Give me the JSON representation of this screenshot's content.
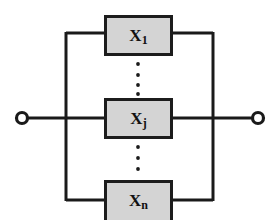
{
  "figure": {
    "kind": "reliability-block-diagram",
    "topology": "parallel",
    "background_color": "#ffffff",
    "line_color": "#1a1a1a",
    "block_fill_color": "#d4d4d4",
    "block_border_color": "#1c1c1c"
  },
  "terminals": {
    "left": {
      "name": "left-terminal",
      "cx": 22,
      "cy": 118,
      "r": 6
    },
    "right": {
      "name": "right-terminal",
      "cx": 258,
      "cy": 118,
      "r": 6
    }
  },
  "bus": {
    "left_x": 66,
    "right_x": 213,
    "top_y": 33,
    "bottom_y": 200,
    "center_y": 118,
    "stroke_width": 3
  },
  "blocks": [
    {
      "id": "block-x1",
      "base": "X",
      "subscript": "1",
      "label": "X1",
      "x": 104,
      "y": 15,
      "width": 69,
      "height": 41,
      "connector_y": 33
    },
    {
      "id": "block-xj",
      "base": "X",
      "subscript": "j",
      "label": "Xj",
      "x": 104,
      "y": 98,
      "width": 69,
      "height": 41,
      "connector_y": 118
    },
    {
      "id": "block-xn",
      "base": "X",
      "subscript": "n",
      "label": "Xn",
      "x": 104,
      "y": 180,
      "width": 69,
      "height": 41,
      "connector_y": 200
    }
  ],
  "ellipses": [
    {
      "id": "ellipsis-upper",
      "x": 138,
      "dots": [
        64,
        75,
        85,
        94
      ],
      "radius": 1.9
    },
    {
      "id": "ellipsis-lower",
      "x": 138,
      "dots": [
        147,
        158,
        169
      ],
      "radius": 1.9
    }
  ]
}
